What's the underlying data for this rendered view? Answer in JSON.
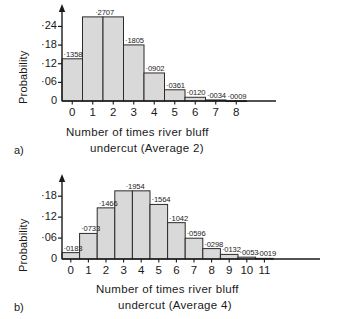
{
  "chart_data": [
    {
      "id": "a",
      "type": "bar",
      "title": "",
      "panel_label": "a)",
      "xlabel_line1": "Number of times river bluff",
      "xlabel_line2": "undercut    (Average 2)",
      "ylabel": "Probability",
      "categories": [
        "0",
        "1",
        "2",
        "3",
        "4",
        "5",
        "6",
        "7",
        "8"
      ],
      "values": [
        0.1358,
        0.2707,
        0.2707,
        0.1805,
        0.0902,
        0.0361,
        0.012,
        0.0034,
        0.0009
      ],
      "data_labels": [
        "·1358",
        "·2707",
        "",
        "·1805",
        "·0902",
        "·0361",
        "·0120",
        "·0034",
        "·0009"
      ],
      "yticks": [
        "0",
        "·06",
        "·12",
        "·18",
        "·24"
      ],
      "ytick_values": [
        0,
        0.06,
        0.12,
        0.18,
        0.24
      ],
      "ylim": [
        0,
        0.28
      ],
      "grid": false,
      "legend": "none"
    },
    {
      "id": "b",
      "type": "bar",
      "title": "",
      "panel_label": "b)",
      "xlabel_line1": "Number of times river bluff",
      "xlabel_line2": "undercut    (Average 4)",
      "ylabel": "Probability",
      "categories": [
        "0",
        "1",
        "2",
        "3",
        "4",
        "5",
        "6",
        "7",
        "8",
        "9",
        "10",
        "11"
      ],
      "values": [
        0.0183,
        0.0733,
        0.1466,
        0.1954,
        0.1954,
        0.1564,
        0.1042,
        0.0596,
        0.0298,
        0.0132,
        0.0053,
        0.0019
      ],
      "data_labels": [
        "·0183",
        "·0733",
        "·1466",
        "·1954",
        "",
        "·1564",
        "·1042",
        "·0596",
        "·0298",
        "·0132",
        "·0053",
        "·0019"
      ],
      "yticks": [
        "0",
        "·06",
        "·12",
        "·18"
      ],
      "ytick_values": [
        0,
        0.06,
        0.12,
        0.18
      ],
      "ylim": [
        0,
        0.215
      ],
      "grid": false,
      "legend": "none"
    }
  ],
  "style": {
    "bar_fill": "#d9d9d9",
    "bar_stroke": "#2b2b2b",
    "axis_color": "#1a1a1a",
    "background": "#ffffff"
  }
}
